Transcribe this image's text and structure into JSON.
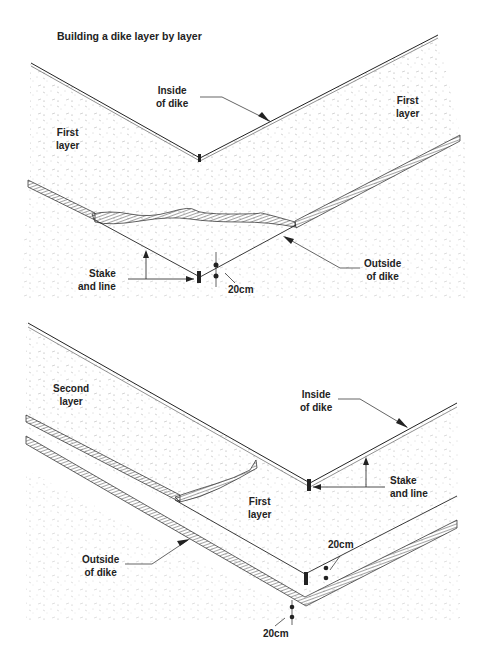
{
  "title": "Building a dike layer by layer",
  "panels": [
    {
      "id": "top",
      "labels": {
        "inside_of_dike": [
          "Inside",
          "of dike"
        ],
        "first_layer_left": [
          "First",
          "layer"
        ],
        "first_layer_right": [
          "First",
          "layer"
        ],
        "stake_and_line": [
          "Stake",
          "and line"
        ],
        "outside_of_dike": [
          "Outside",
          "of dike"
        ],
        "dimension": "20cm"
      }
    },
    {
      "id": "bottom",
      "labels": {
        "second_layer": [
          "Second",
          "layer"
        ],
        "inside_of_dike": [
          "Inside",
          "of dike"
        ],
        "stake_and_line": [
          "Stake",
          "and line"
        ],
        "first_layer": [
          "First",
          "layer"
        ],
        "outside_of_dike": [
          "Outside",
          "of dike"
        ],
        "dimension_upper": "20cm",
        "dimension_lower": "20cm"
      }
    }
  ],
  "colors": {
    "ink": "#222222",
    "background": "#ffffff",
    "speckle": "#9a9a9a"
  }
}
